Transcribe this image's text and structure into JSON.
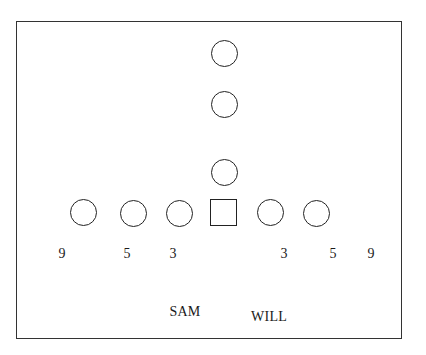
{
  "diagram": {
    "type": "football-defensive-alignment",
    "frame": {
      "left": 16,
      "top": 21,
      "right": 404,
      "bottom": 341
    },
    "backfield_players": [
      {
        "shape": "circle",
        "x": 224,
        "y": 53
      },
      {
        "shape": "circle",
        "x": 224,
        "y": 104
      },
      {
        "shape": "circle",
        "x": 224,
        "y": 172
      }
    ],
    "line_players": [
      {
        "shape": "circle",
        "x": 83,
        "y": 212
      },
      {
        "shape": "circle",
        "x": 133,
        "y": 212
      },
      {
        "shape": "circle",
        "x": 179,
        "y": 212
      },
      {
        "shape": "square",
        "x": 223,
        "y": 212,
        "role": "center"
      },
      {
        "shape": "circle",
        "x": 270,
        "y": 212
      },
      {
        "shape": "circle",
        "x": 316,
        "y": 212
      }
    ],
    "techniques": [
      {
        "label": "9",
        "x": 62,
        "y": 247
      },
      {
        "label": "5",
        "x": 127,
        "y": 247
      },
      {
        "label": "3",
        "x": 173,
        "y": 247
      },
      {
        "label": "3",
        "x": 284,
        "y": 247
      },
      {
        "label": "5",
        "x": 333,
        "y": 247
      },
      {
        "label": "9",
        "x": 371,
        "y": 247
      }
    ],
    "linebackers": [
      {
        "label": "SAM",
        "x": 185,
        "y": 305
      },
      {
        "label": "WILL",
        "x": 269,
        "y": 310
      }
    ]
  }
}
